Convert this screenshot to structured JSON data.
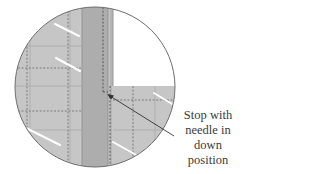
{
  "figure": {
    "type": "magnified sewing detail",
    "caption_lines": [
      "Stop with",
      "needle in",
      "down",
      "position"
    ],
    "colors": {
      "fabric": "#c4c4c4",
      "strip": "#adadad",
      "background_quadrant": "#ffffff",
      "outline": "#6e6e6e",
      "stitch": "#555555",
      "highlight": "#ffffff",
      "arrow": "#333333",
      "text": "#3a3a3a"
    }
  }
}
